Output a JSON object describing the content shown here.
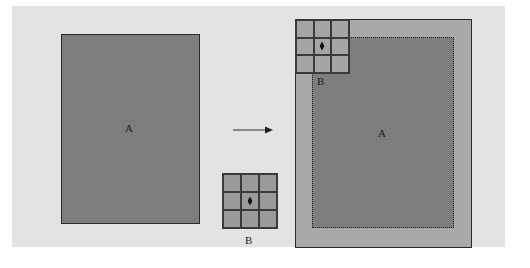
{
  "diagram": {
    "left": {
      "rect_label": "A"
    },
    "arrow": {
      "direction": "right",
      "icon": "arrow-right-icon"
    },
    "kernel": {
      "label": "B",
      "rows": 3,
      "cols": 3,
      "center_marker": "diamond"
    },
    "right": {
      "inner_rect_label": "A",
      "kernel_label": "B",
      "inner_border_style": "dotted"
    },
    "colors": {
      "background_panel": "#e3e3e1",
      "rect_a_fill": "#7d7d7d",
      "outer_padding_fill": "#a9a9a9",
      "kernel_fill": "#9a9a9a",
      "border": "#2a2a2a"
    }
  }
}
